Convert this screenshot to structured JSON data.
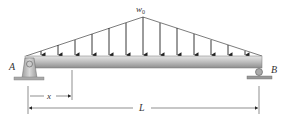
{
  "diagram": {
    "type": "simply-supported-beam",
    "load": {
      "kind": "triangular-distributed",
      "peak_label": "w",
      "peak_subscript": "0",
      "peak_position": "midspan",
      "arrow_count": 11
    },
    "supports": {
      "left": {
        "label": "A",
        "type": "pin"
      },
      "right": {
        "label": "B",
        "type": "roller"
      }
    },
    "dimensions": {
      "x_label": "x",
      "span_label": "L"
    },
    "colors": {
      "beam_light": "#d8d8d8",
      "beam_dark": "#9a9a9a",
      "support": "#bdbdbd",
      "line": "#333333"
    }
  }
}
